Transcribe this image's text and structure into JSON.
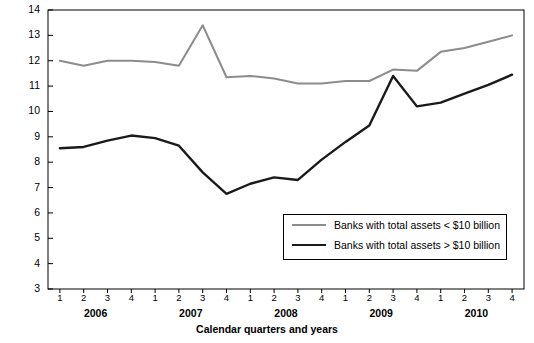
{
  "chart_data": {
    "type": "line",
    "title": "",
    "xlabel": "Calendar quarters and years",
    "ylabel": "Ratio of Tier 1 capital to risk-adjusted assets (%)",
    "ylim": [
      3,
      14
    ],
    "yticks": [
      "3",
      "4",
      "5",
      "6",
      "7",
      "8",
      "9",
      "10",
      "11",
      "12",
      "13",
      "14"
    ],
    "categories": [
      "1",
      "2",
      "3",
      "4",
      "1",
      "2",
      "3",
      "4",
      "1",
      "2",
      "3",
      "4",
      "1",
      "2",
      "3",
      "4",
      "1",
      "2",
      "3",
      "4"
    ],
    "year_groups": [
      {
        "label": "2006",
        "start_index": 0,
        "end_index": 3
      },
      {
        "label": "2007",
        "start_index": 4,
        "end_index": 7
      },
      {
        "label": "2008",
        "start_index": 8,
        "end_index": 11
      },
      {
        "label": "2009",
        "start_index": 12,
        "end_index": 15
      },
      {
        "label": "2010",
        "start_index": 16,
        "end_index": 19
      }
    ],
    "grid": false,
    "legend_position": "bottom-right",
    "series": [
      {
        "name": "Banks with total assets < $10 billion",
        "color": "#8c8c8c",
        "values": [
          12.0,
          11.8,
          12.0,
          12.0,
          11.95,
          11.8,
          13.4,
          11.35,
          11.4,
          11.3,
          11.1,
          11.1,
          11.2,
          11.2,
          11.65,
          11.6,
          12.35,
          12.5,
          12.75,
          13.0
        ]
      },
      {
        "name": "Banks with total assets > $10 billion",
        "color": "#1a1a1a",
        "values": [
          8.55,
          8.6,
          8.85,
          9.05,
          8.95,
          8.65,
          7.6,
          6.75,
          7.15,
          7.4,
          7.3,
          8.1,
          8.8,
          9.45,
          11.4,
          10.2,
          10.35,
          10.7,
          11.05,
          11.45
        ]
      }
    ]
  },
  "legend": {
    "items": [
      {
        "label": "Banks with total assets < $10 billion",
        "color": "#8c8c8c"
      },
      {
        "label": "Banks with total assets > $10 billion",
        "color": "#1a1a1a"
      }
    ]
  }
}
